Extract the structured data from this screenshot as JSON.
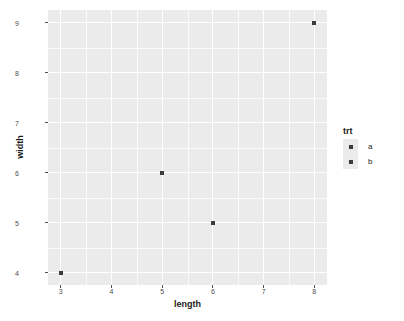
{
  "chart_data": {
    "type": "scatter",
    "title": "",
    "xlabel": "length",
    "ylabel": "width",
    "xlim": [
      2.75,
      8.25
    ],
    "ylim": [
      3.75,
      9.25
    ],
    "grid": true,
    "legend_position": "right",
    "legend_title": "trt",
    "x_ticks": [
      "3",
      "4",
      "5",
      "6",
      "7",
      "8"
    ],
    "y_ticks": [
      "4",
      "5",
      "6",
      "7",
      "8",
      "9"
    ],
    "x_tick_values": [
      3,
      4,
      5,
      6,
      7,
      8
    ],
    "y_tick_values": [
      4,
      5,
      6,
      7,
      8,
      9
    ],
    "x_minor_values": [
      3.5,
      4.5,
      5.5,
      6.5,
      7.5
    ],
    "y_minor_values": [
      4.5,
      5.5,
      6.5,
      7.5,
      8.5
    ],
    "points": [
      {
        "x": 3,
        "y": 4,
        "group": "a"
      },
      {
        "x": 5,
        "y": 6,
        "group": "a"
      },
      {
        "x": 6,
        "y": 5,
        "group": "b"
      },
      {
        "x": 8,
        "y": 9,
        "group": "b"
      }
    ],
    "series": [
      {
        "name": "a",
        "x": [
          3,
          5
        ],
        "y": [
          4,
          6
        ]
      },
      {
        "name": "b",
        "x": [
          6,
          8
        ],
        "y": [
          5,
          9
        ]
      }
    ],
    "legend_entries": [
      {
        "label": "a",
        "color": "#3b3b3b"
      },
      {
        "label": "b",
        "color": "#3b3b3b"
      }
    ],
    "colors": {
      "panel_background": "#ebebeb",
      "gridline": "#ffffff",
      "point": "#3b3b3b",
      "text": "#1a1a1a",
      "tick_text": "#4d4d4d",
      "plot_background": "#ffffff"
    }
  }
}
